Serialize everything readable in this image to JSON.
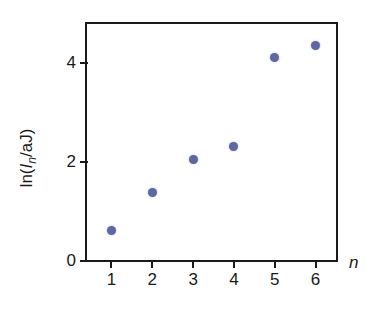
{
  "chart_data": {
    "type": "scatter",
    "title": "",
    "xlabel": "n",
    "ylabel": "ln(In/aJ)",
    "ylabel_parts": {
      "prefix": "ln(",
      "var": "I",
      "subscript": "n",
      "suffix": "/aJ)"
    },
    "x": [
      1,
      2,
      3,
      4,
      5,
      6
    ],
    "values": [
      0.59,
      1.37,
      2.02,
      2.28,
      4.08,
      4.32
    ],
    "xlim": [
      0.4,
      6.5
    ],
    "ylim": [
      0,
      4.76
    ],
    "xticks": [
      1,
      2,
      3,
      4,
      5,
      6
    ],
    "xtick_labels": [
      "1",
      "2",
      "3",
      "4",
      "5",
      "6"
    ],
    "yticks": [
      0,
      2,
      4
    ],
    "ytick_labels": [
      "0",
      "2",
      "4"
    ],
    "grid": false,
    "legend": false,
    "marker": {
      "shape": "circle",
      "color": "#5d67a0",
      "size": 9
    },
    "frame_color": "#1a1a1a",
    "background": "#ffffff"
  }
}
